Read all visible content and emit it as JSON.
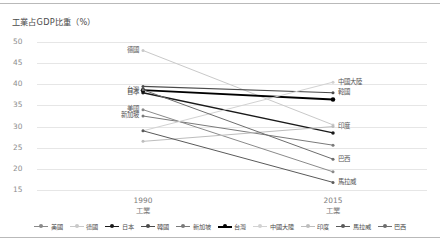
{
  "chart_data": {
    "type": "line",
    "title": "工業占GDP比重（%）",
    "xlabel": "",
    "ylabel": "",
    "categories": [
      "1990\n工業",
      "2015\n工業"
    ],
    "x_axis": {
      "ticks": [
        {
          "year": "1990",
          "sector": "工業"
        },
        {
          "year": "2015",
          "sector": "工業"
        }
      ]
    },
    "ylim": [
      15,
      50
    ],
    "yticks": [
      "50",
      "45",
      "40",
      "35",
      "30",
      "25",
      "20",
      "15"
    ],
    "grid": true,
    "legend_position": "bottom",
    "series": [
      {
        "name": "美國",
        "values": [
          34.0,
          19.3
        ],
        "color": "#8a8a8a",
        "width": 1.0
      },
      {
        "name": "德國",
        "values": [
          48.0,
          30.4
        ],
        "color": "#c9c9c9",
        "width": 1.0
      },
      {
        "name": "日本",
        "values": [
          38.0,
          28.5
        ],
        "color": "#1a1a1a",
        "width": 1.4
      },
      {
        "name": "韓國",
        "values": [
          39.5,
          38.0
        ],
        "color": "#4a4a4a",
        "width": 1.2
      },
      {
        "name": "新加坡",
        "values": [
          32.5,
          25.6
        ],
        "color": "#7a7a7a",
        "width": 1.0
      },
      {
        "name": "台灣",
        "values": [
          38.6,
          36.4
        ],
        "color": "#000000",
        "width": 1.8
      },
      {
        "name": "中國大陸",
        "values": [
          29.0,
          40.5
        ],
        "color": "#d2d2d2",
        "width": 1.0
      },
      {
        "name": "印度",
        "values": [
          26.5,
          30.0
        ],
        "color": "#bdbdbd",
        "width": 1.0
      },
      {
        "name": "馬拉威",
        "values": [
          29.0,
          16.8
        ],
        "color": "#5a5a5a",
        "width": 1.0
      },
      {
        "name": "巴西",
        "values": [
          38.7,
          22.3
        ],
        "color": "#6d6d6d",
        "width": 1.0
      }
    ],
    "point_labels": {
      "left": [
        "德國",
        "台灣",
        "日本",
        "美國",
        "新加坡"
      ],
      "right": [
        "中國大陸",
        "韓國",
        "巴西",
        "印度",
        "馬拉威"
      ]
    }
  },
  "legend": {
    "items": [
      {
        "label": "美國"
      },
      {
        "label": "德國"
      },
      {
        "label": "日本"
      },
      {
        "label": "韓國"
      },
      {
        "label": "新加坡"
      },
      {
        "label": "台灣"
      },
      {
        "label": "中國大陸"
      },
      {
        "label": "印度"
      },
      {
        "label": "馬拉威"
      },
      {
        "label": "巴西"
      }
    ]
  }
}
